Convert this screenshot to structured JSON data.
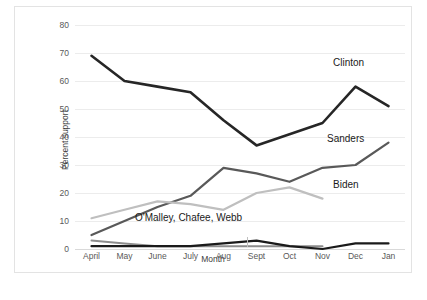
{
  "chart_data": {
    "type": "line",
    "title": "",
    "xlabel": "Month",
    "ylabel": "Percent support",
    "categories": [
      "April",
      "May",
      "June",
      "July",
      "Aug",
      "Sept",
      "Oct",
      "Nov",
      "Dec",
      "Jan"
    ],
    "ylim": [
      0,
      80
    ],
    "yticks": [
      0,
      10,
      20,
      30,
      40,
      50,
      60,
      70,
      80
    ],
    "grid": true,
    "legend_position": "inline-annotations",
    "series": [
      {
        "name": "Clinton",
        "color": "#262626",
        "values": [
          69,
          60,
          58,
          56,
          46,
          37,
          41,
          45,
          58,
          51
        ]
      },
      {
        "name": "Sanders",
        "color": "#595959",
        "values": [
          5,
          10,
          15,
          19,
          29,
          27,
          24,
          29,
          30,
          38
        ]
      },
      {
        "name": "Biden",
        "color": "#bfbfbf",
        "values": [
          11,
          14,
          17,
          16,
          14,
          20,
          22,
          18,
          null,
          null
        ]
      },
      {
        "name": "O'Malley, Chafee, Webb",
        "color": "#1a1a1a",
        "values": [
          1,
          1,
          1,
          1,
          2,
          3,
          1,
          0,
          2,
          2
        ]
      },
      {
        "name": "OMalley-secondary",
        "color": "#8c8c8c",
        "values": [
          3,
          2,
          1,
          1,
          1,
          1,
          1,
          1,
          null,
          null
        ]
      }
    ],
    "annotations": [
      {
        "text": "Clinton",
        "series": "Clinton"
      },
      {
        "text": "Sanders",
        "series": "Sanders"
      },
      {
        "text": "Biden",
        "series": "Biden"
      },
      {
        "text": "O'Malley, Chafee, Webb",
        "series": "O'Malley, Chafee, Webb"
      }
    ]
  }
}
